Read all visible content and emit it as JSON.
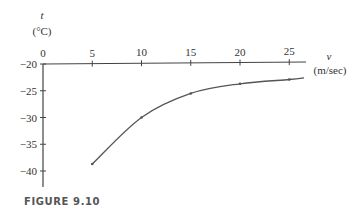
{
  "figure": {
    "caption": "FIGURE 9.10"
  },
  "chart_data": {
    "type": "line",
    "title": "",
    "xlabel": "v",
    "xlabel_unit": "(m/sec)",
    "ylabel": "t",
    "ylabel_unit": "(°C)",
    "x": [
      5,
      10,
      15,
      20,
      25
    ],
    "series": [
      {
        "name": "t vs v",
        "values": [
          -38.7,
          -30.0,
          -25.5,
          -23.7,
          -22.9
        ]
      }
    ],
    "curve_extends_to": {
      "x": 26.5,
      "y": -22.6
    },
    "xlim": [
      0,
      27
    ],
    "ylim": [
      -43,
      -20
    ],
    "x_ticks": [
      0,
      5,
      10,
      15,
      20,
      25
    ],
    "x_tick_labels": [
      "0",
      "5",
      "10",
      "15",
      "20",
      "25"
    ],
    "y_ticks": [
      -20,
      -25,
      -30,
      -35,
      -40
    ],
    "y_tick_labels": [
      "−20",
      "−25",
      "−30",
      "−35",
      "−40"
    ],
    "x_axis_position": "top (at t = -20)",
    "grid": false,
    "legend": "none",
    "colors": {
      "axis": "#444444",
      "curve": "#555555",
      "text": "#333333"
    }
  }
}
